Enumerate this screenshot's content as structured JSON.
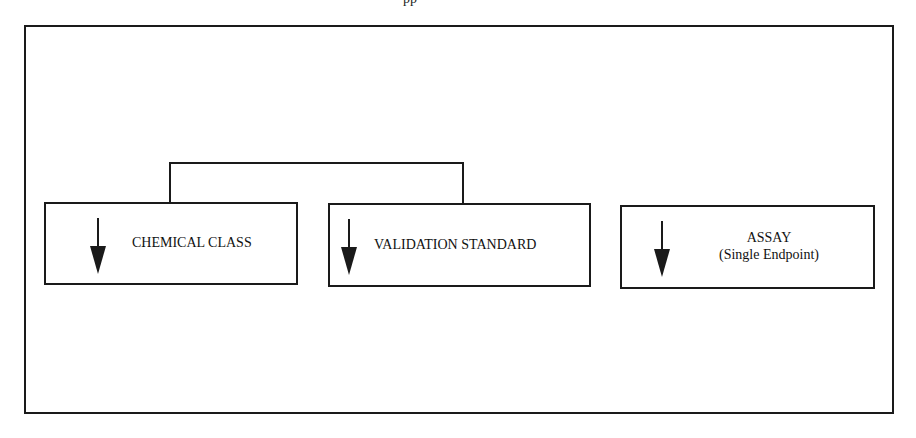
{
  "header": {
    "fragment_text": "pp"
  },
  "diagram": {
    "nodes": [
      {
        "id": "chemical-class",
        "label": "CHEMICAL CLASS",
        "sublabel": null,
        "icon": "arrow-down-icon"
      },
      {
        "id": "validation-standard",
        "label": "VALIDATION STANDARD",
        "sublabel": null,
        "icon": "arrow-down-icon"
      },
      {
        "id": "assay",
        "label": "ASSAY",
        "sublabel": "(Single Endpoint)",
        "icon": "arrow-down-icon"
      }
    ],
    "edges": [
      {
        "from": "chemical-class",
        "to": "validation-standard",
        "type": "bracket-connector"
      }
    ],
    "colors": {
      "stroke": "#1a1a1a",
      "background": "#ffffff",
      "text": "#111111"
    }
  }
}
